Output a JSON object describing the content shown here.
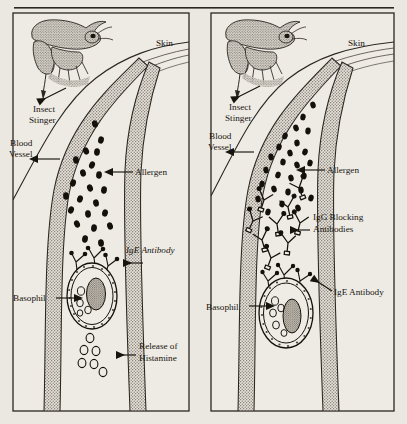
{
  "figure": {
    "title_rule": "horizontal-rule",
    "background_color": "#ebe8e2",
    "ink_color": "#17140f",
    "vessel_wall_color": "#b9b4ab",
    "panels": [
      {
        "id": "left-panel",
        "caption_role": "allergic-reaction-without-blocking-antibodies",
        "labels": [
          {
            "name": "skin",
            "text": "Skin",
            "style": "roman",
            "x": 156,
            "y": 46
          },
          {
            "name": "insect-stinger",
            "text": "Insect",
            "text2": "Stinger",
            "style": "roman",
            "x": 32,
            "y": 111
          },
          {
            "name": "blood-vessel",
            "text": "Blood",
            "text2": "Vessel",
            "style": "roman",
            "x": 8,
            "y": 146
          },
          {
            "name": "allergen",
            "text": "Allergen",
            "style": "roman",
            "x": 117,
            "y": 175
          },
          {
            "name": "ige-antibody",
            "text": "IgE Antibody",
            "style": "italic",
            "x": 126,
            "y": 254
          },
          {
            "name": "basophil",
            "text": "Basophil",
            "style": "roman",
            "x": 12,
            "y": 295
          },
          {
            "name": "release-of-histamine",
            "text": "Release of",
            "text2": "Histamine",
            "style": "roman",
            "x": 138,
            "y": 349
          }
        ],
        "allergen_count": 22,
        "histamine_granule_count": 7,
        "igg_antibody_count": 0,
        "has_histamine_release": true
      },
      {
        "id": "right-panel",
        "caption_role": "allergic-reaction-blocked-by-igg-antibodies",
        "labels": [
          {
            "name": "skin",
            "text": "Skin",
            "style": "roman",
            "x": 348,
            "y": 46
          },
          {
            "name": "insect-stinger",
            "text": "Insect",
            "text2": "Stinger",
            "style": "roman",
            "x": 228,
            "y": 106
          },
          {
            "name": "blood-vessel",
            "text": "Blood",
            "text2": "Vessel",
            "style": "roman",
            "x": 208,
            "y": 139
          },
          {
            "name": "allergen",
            "text": "Allergen",
            "style": "roman",
            "x": 308,
            "y": 169
          },
          {
            "name": "igg-blocking-antibodies",
            "text": "IgG Blocking",
            "text2": "Antibodies",
            "style": "roman",
            "x": 313,
            "y": 218
          },
          {
            "name": "ige-antibody",
            "text": "IgE Antibody",
            "style": "roman",
            "x": 334,
            "y": 291
          },
          {
            "name": "basophil",
            "text": "Basophil",
            "style": "roman",
            "x": 206,
            "y": 303
          }
        ],
        "allergen_count": 26,
        "histamine_granule_count": 0,
        "igg_antibody_count": 9,
        "has_histamine_release": false
      }
    ],
    "legend_shapes": {
      "allergen": "filled-black-oval",
      "igg_antibody": "open-y-shape",
      "ige_antibody": "small-y-shape-on-cell-surface",
      "histamine": "open-small-circle",
      "basophil": "oval-cell-with-stippled-nucleus",
      "insect": "stippled-bee",
      "vessel_wall": "stippled-gray-band"
    }
  }
}
